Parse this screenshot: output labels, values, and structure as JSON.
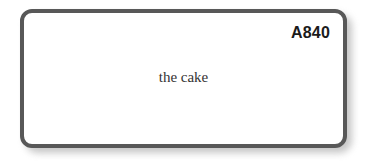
{
  "canvas": {
    "background_color": "#ffffff",
    "width": 366,
    "height": 166
  },
  "card": {
    "border_color": "#585858",
    "fill_color": "#ffffff",
    "shadow_color": "#9a9a9a",
    "code_label": "A840",
    "code_color": "#1b1b1b",
    "body_text": "the cake",
    "body_text_color": "#333333"
  }
}
